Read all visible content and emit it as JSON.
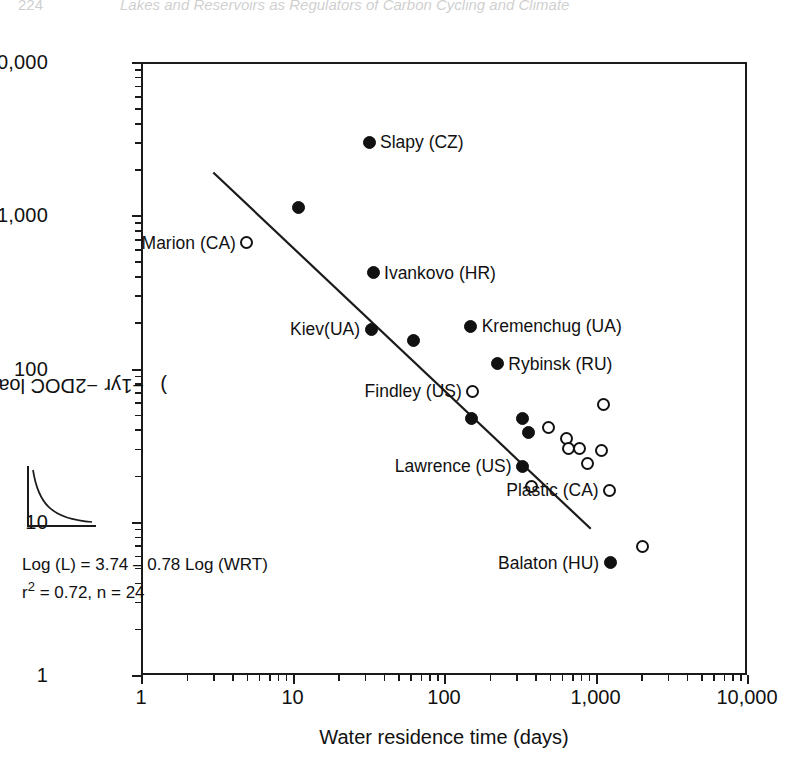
{
  "figure": {
    "name": "doc-loading-vs-water-residence-time"
  },
  "axes": {
    "y": {
      "title_prefix": "DOC loading (g C m",
      "title_sup1": "−2",
      "title_mid": " yr",
      "title_sup2": "−1",
      "title_suffix": ")",
      "title_plain": "DOC loading (g C m−2 yr−1)",
      "ticks": [
        "1",
        "10",
        "100",
        "1,000",
        "10,000"
      ],
      "scale": "log",
      "min": 1,
      "max": 10000
    },
    "x": {
      "title": "Water residence time (days)",
      "ticks": [
        "1",
        "10",
        "100",
        "1,000",
        "10,000"
      ],
      "scale": "log",
      "min": 1,
      "max": 10000
    }
  },
  "annotation": {
    "equation": "Log (L) = 3.74 – 0.78 Log (WRT)",
    "stats_prefix": "r",
    "stats_sup": "2",
    "stats_rest": " = 0.72, n = 24",
    "stats_plain": "r2 = 0.72, n = 24",
    "r_squared": 0.72,
    "n": 24,
    "intercept": 3.74,
    "slope": -0.78
  },
  "inset": {
    "name": "decay-curve-sketch",
    "description": "small decaying curve sketch"
  },
  "page_header": {
    "number": "224",
    "text": "Lakes and Reservoirs as Regulators of Carbon Cycling and Climate"
  },
  "colors": {
    "ink": "#111111",
    "frame": "#1a1a1a",
    "background": "#ffffff"
  },
  "chart_data": {
    "type": "scatter",
    "title": "",
    "xlabel": "Water residence time (days)",
    "ylabel": "DOC loading (g C m−2 yr−1)",
    "xscale": "log",
    "yscale": "log",
    "xlim": [
      1,
      10000
    ],
    "ylim": [
      1,
      10000
    ],
    "grid": false,
    "legend": "none",
    "series": [
      {
        "name": "Reservoirs (filled circles)",
        "marker": "filled-circle",
        "points": [
          {
            "label": "Slapy (CZ)",
            "x": 32,
            "y": 3000,
            "label_pos": "right"
          },
          {
            "label": "",
            "x": 11,
            "y": 1120,
            "label_pos": "none"
          },
          {
            "label": "Ivankovo (HR)",
            "x": 34,
            "y": 420,
            "label_pos": "right"
          },
          {
            "label": "Kiev(UA)",
            "x": 33,
            "y": 180,
            "label_pos": "left"
          },
          {
            "label": "",
            "x": 63,
            "y": 152,
            "label_pos": "none"
          },
          {
            "label": "Kremenchug (UA)",
            "x": 150,
            "y": 188,
            "label_pos": "right"
          },
          {
            "label": "Rybinsk (RU)",
            "x": 225,
            "y": 107,
            "label_pos": "right"
          },
          {
            "label": "",
            "x": 152,
            "y": 47,
            "label_pos": "none"
          },
          {
            "label": "",
            "x": 330,
            "y": 47,
            "label_pos": "none"
          },
          {
            "label": "",
            "x": 360,
            "y": 38,
            "label_pos": "none"
          },
          {
            "label": "Lawrence (US)",
            "x": 330,
            "y": 23,
            "label_pos": "left"
          },
          {
            "label": "Balaton (HU)",
            "x": 1250,
            "y": 5.4,
            "label_pos": "left"
          }
        ]
      },
      {
        "name": "Lakes (open circles)",
        "marker": "open-circle",
        "points": [
          {
            "label": "Marion (CA)",
            "x": 5.0,
            "y": 660,
            "label_pos": "left"
          },
          {
            "label": "Findley (US)",
            "x": 155,
            "y": 71,
            "label_pos": "left"
          },
          {
            "label": "",
            "x": 490,
            "y": 41,
            "label_pos": "none"
          },
          {
            "label": "",
            "x": 640,
            "y": 35,
            "label_pos": "none"
          },
          {
            "label": "",
            "x": 660,
            "y": 30,
            "label_pos": "none"
          },
          {
            "label": "",
            "x": 790,
            "y": 30,
            "label_pos": "none"
          },
          {
            "label": "",
            "x": 880,
            "y": 24,
            "label_pos": "none"
          },
          {
            "label": "",
            "x": 1100,
            "y": 29,
            "label_pos": "none"
          },
          {
            "label": "",
            "x": 1130,
            "y": 58,
            "label_pos": "none"
          },
          {
            "label": "Plastic (CA)",
            "x": 1240,
            "y": 16,
            "label_pos": "left"
          },
          {
            "label": "",
            "x": 2050,
            "y": 6.9,
            "label_pos": "none"
          },
          {
            "label": "",
            "x": 380,
            "y": 17,
            "label_pos": "none"
          }
        ]
      }
    ],
    "fit_line": {
      "name": "regression-line",
      "equation": "Log (L) = 3.74 – 0.78 Log (WRT)",
      "x_start": 3.0,
      "y_start": 1900,
      "x_end": 930,
      "y_end": 9.0
    }
  }
}
